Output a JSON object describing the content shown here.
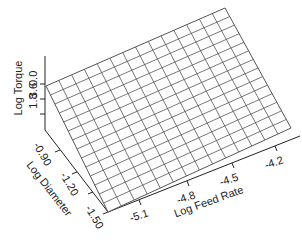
{
  "chart_data": {
    "type": "surface3d",
    "title": "",
    "axes": {
      "x": {
        "label": "Log Feed Rate",
        "ticks": [
          "-5.1",
          "-4.8",
          "-4.5",
          "-4.2"
        ]
      },
      "y": {
        "label": "Log Diameter",
        "ticks": [
          "-0.90",
          "-1.20",
          "-1.50"
        ]
      },
      "z": {
        "label": "Log Torque",
        "ticks": [
          "0.0",
          "1.8",
          "3.6"
        ]
      }
    },
    "surface": {
      "grid_rows": 14,
      "grid_cols": 14,
      "description": "Planar surface rising with feed rate; torque increases as log feed rate and log diameter increase",
      "line_color": "#555555",
      "fill_color": "#ffffff"
    },
    "grid": false,
    "legend": null
  }
}
